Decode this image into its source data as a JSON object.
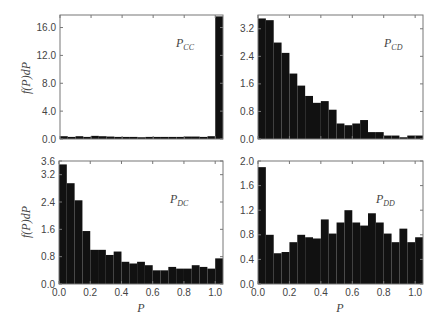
{
  "figure": {
    "ylabel": "f(P)dP",
    "xlabel": "P"
  },
  "chart_data": [
    {
      "type": "bar",
      "title": "P_CC",
      "panel_label": "P",
      "panel_sub": "CC",
      "xlabel": "",
      "ylabel": "f(P)dP",
      "xlim": [
        0.0,
        1.05
      ],
      "ylim": [
        0.0,
        17.8
      ],
      "yticks": [
        "0.0",
        "4.0",
        "8.0",
        "12.0",
        "16.0"
      ],
      "ytick_values": [
        0,
        4,
        8,
        12,
        16
      ],
      "xticks": [],
      "bin_width": 0.05,
      "bin_starts": [
        0.0,
        0.05,
        0.1,
        0.15,
        0.2,
        0.25,
        0.3,
        0.35,
        0.4,
        0.45,
        0.5,
        0.55,
        0.6,
        0.65,
        0.7,
        0.75,
        0.8,
        0.85,
        0.9,
        0.95,
        1.0
      ],
      "values": [
        0.4,
        0.3,
        0.4,
        0.3,
        0.45,
        0.4,
        0.35,
        0.3,
        0.3,
        0.3,
        0.25,
        0.3,
        0.3,
        0.3,
        0.3,
        0.3,
        0.35,
        0.35,
        0.3,
        0.4,
        17.6
      ]
    },
    {
      "type": "bar",
      "title": "P_CD",
      "panel_label": "P",
      "panel_sub": "CD",
      "xlabel": "",
      "ylabel": "",
      "xlim": [
        0.0,
        1.05
      ],
      "ylim": [
        0.0,
        3.6
      ],
      "yticks": [
        "0.0",
        "0.8",
        "1.6",
        "2.4",
        "3.2"
      ],
      "ytick_values": [
        0,
        0.8,
        1.6,
        2.4,
        3.2
      ],
      "xticks": [],
      "bin_width": 0.05,
      "bin_starts": [
        0.0,
        0.05,
        0.1,
        0.15,
        0.2,
        0.25,
        0.3,
        0.35,
        0.4,
        0.45,
        0.5,
        0.55,
        0.6,
        0.65,
        0.7,
        0.75,
        0.8,
        0.85,
        0.9,
        0.95,
        1.0
      ],
      "values": [
        3.5,
        3.45,
        2.8,
        2.5,
        1.9,
        1.55,
        1.25,
        1.05,
        1.1,
        0.85,
        0.45,
        0.4,
        0.45,
        0.55,
        0.2,
        0.2,
        0.1,
        0.1,
        0.05,
        0.1,
        0.1
      ]
    },
    {
      "type": "bar",
      "title": "P_DC",
      "panel_label": "P",
      "panel_sub": "DC",
      "xlabel": "P",
      "ylabel": "f(P)dP",
      "xlim": [
        0.0,
        1.05
      ],
      "ylim": [
        0.0,
        3.6
      ],
      "yticks": [
        "0.0",
        "0.8",
        "1.6",
        "2.4",
        "3.2",
        "3.6"
      ],
      "ytick_values": [
        0,
        0.8,
        1.6,
        2.4,
        3.2,
        3.6
      ],
      "xticks": [
        "0.0",
        "0.2",
        "0.4",
        "0.6",
        "0.8",
        "1.0"
      ],
      "xtick_values": [
        0,
        0.2,
        0.4,
        0.6,
        0.8,
        1.0
      ],
      "bin_width": 0.05,
      "bin_starts": [
        0.0,
        0.05,
        0.1,
        0.15,
        0.2,
        0.25,
        0.3,
        0.35,
        0.4,
        0.45,
        0.5,
        0.55,
        0.6,
        0.65,
        0.7,
        0.75,
        0.8,
        0.85,
        0.9,
        0.95,
        1.0
      ],
      "values": [
        3.5,
        2.95,
        2.45,
        1.55,
        1.0,
        1.0,
        0.85,
        0.95,
        0.65,
        0.6,
        0.65,
        0.55,
        0.4,
        0.4,
        0.5,
        0.45,
        0.45,
        0.55,
        0.5,
        0.45,
        0.75
      ]
    },
    {
      "type": "bar",
      "title": "P_DD",
      "panel_label": "P",
      "panel_sub": "DD",
      "xlabel": "P",
      "ylabel": "",
      "xlim": [
        0.0,
        1.05
      ],
      "ylim": [
        0.0,
        2.0
      ],
      "yticks": [
        "0.0",
        "0.4",
        "0.8",
        "1.2",
        "1.6",
        "2.0"
      ],
      "ytick_values": [
        0,
        0.4,
        0.8,
        1.2,
        1.6,
        2.0
      ],
      "xticks": [
        "0.0",
        "0.2",
        "0.4",
        "0.6",
        "0.8",
        "1.0"
      ],
      "xtick_values": [
        0,
        0.2,
        0.4,
        0.6,
        0.8,
        1.0
      ],
      "bin_width": 0.05,
      "bin_starts": [
        0.0,
        0.05,
        0.1,
        0.15,
        0.2,
        0.25,
        0.3,
        0.35,
        0.4,
        0.45,
        0.5,
        0.55,
        0.6,
        0.65,
        0.7,
        0.75,
        0.8,
        0.85,
        0.9,
        0.95,
        1.0
      ],
      "values": [
        1.9,
        0.8,
        0.5,
        0.52,
        0.68,
        0.8,
        0.76,
        0.74,
        1.05,
        0.82,
        1.0,
        1.2,
        1.0,
        0.95,
        1.15,
        1.0,
        0.82,
        0.68,
        0.9,
        0.68,
        0.76
      ]
    }
  ],
  "layout": {
    "panels": [
      {
        "x0": 60,
        "x1": 223,
        "y0": 15,
        "y1": 139
      },
      {
        "x0": 258,
        "x1": 423,
        "y0": 15,
        "y1": 139
      },
      {
        "x0": 59,
        "x1": 223,
        "y0": 161,
        "y1": 284
      },
      {
        "x0": 258,
        "x1": 423,
        "y0": 161,
        "y1": 284
      }
    ],
    "label_pos": [
      {
        "x": 176,
        "y": 47
      },
      {
        "x": 384,
        "y": 47
      },
      {
        "x": 170,
        "y": 203
      },
      {
        "x": 376,
        "y": 203
      }
    ],
    "bar_color": "#111111",
    "frame_color": "#777777"
  }
}
